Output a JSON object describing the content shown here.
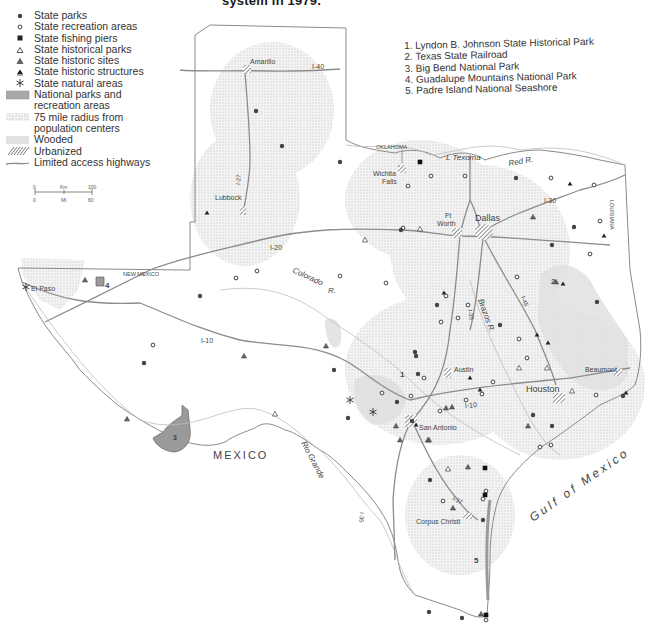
{
  "title_fragment": "system in 1979.",
  "legend": {
    "items": [
      {
        "symbol": "filled-circle",
        "label": "State parks"
      },
      {
        "symbol": "open-circle",
        "label": "State recreation areas"
      },
      {
        "symbol": "filled-square",
        "label": "State fishing piers"
      },
      {
        "symbol": "open-triangle",
        "label": "State historical parks"
      },
      {
        "symbol": "shaded-triangle",
        "label": "State historic sites"
      },
      {
        "symbol": "filled-triangle-bar",
        "label": "State historic structures"
      },
      {
        "symbol": "asterisk",
        "label": "State natural areas"
      },
      {
        "symbol": "gray-swatch",
        "label": "National parks and",
        "label2": "recreation areas"
      },
      {
        "symbol": "dotted-swatch",
        "label": "75 mile radius from",
        "label2": "population centers"
      },
      {
        "symbol": "light-swatch",
        "label": "Wooded"
      },
      {
        "symbol": "hatched-swatch",
        "label": "Urbanized"
      },
      {
        "symbol": "highway-line",
        "label": "Limited access highways"
      }
    ],
    "scale": {
      "km_start": "0",
      "km_label": "Km",
      "km_end": "100",
      "mi_start": "0",
      "mi_label": "Mi",
      "mi_end": "60"
    }
  },
  "numbered_sites": [
    "1.  Lyndon B. Johnson State Historical Park",
    "2.  Texas State Railroad",
    "3.  Big Bend National Park",
    "4.  Guadalupe Mountains National Park",
    "5.  Padre Island National Seashore"
  ],
  "map_labels": {
    "amarillo": "Amarillo",
    "lubbock": "Lubbock",
    "i40": "I-40",
    "i27": "I-27",
    "oklahoma": "OKLAHOMA",
    "wichita1": "Wichita",
    "wichita2": "Falls",
    "texoma": "L Texoma",
    "red_river": "Red R.",
    "i30": "I-30",
    "louisiana": "LOUISIANA",
    "dallas": "Dallas",
    "ftworth1": "Ft",
    "ftworth2": "Worth",
    "i20": "I-20",
    "colorado": "Colorado",
    "colorado_r": "R.",
    "new_mexico": "NEW MEXICO",
    "el_paso": "El Paso",
    "i10": "I-10",
    "i10b": "I-10",
    "i35": "I-35",
    "i35b": "I-35",
    "i45": "I-45",
    "brazos": "Brazos R.",
    "austin": "Austin",
    "houston": "Houston",
    "beaumont": "Beaumont",
    "san_antonio": "San Antonio",
    "mexico": "MEXICO",
    "rio_grande": "Rio Grande",
    "gulf": "Gulf of Mexico",
    "corpus": "Corpus Christi",
    "i37": "I-37",
    "n1": "1",
    "n2": "2",
    "n3": "3",
    "n4": "4",
    "n5": "5"
  },
  "colors": {
    "outline": "#8a8a8a",
    "national_park": "#9a9a9a",
    "wooded": "#e2e2e2",
    "radius_dots": "#bdbdbd",
    "highway": "#8c8c8c",
    "symbol": "#333333"
  }
}
